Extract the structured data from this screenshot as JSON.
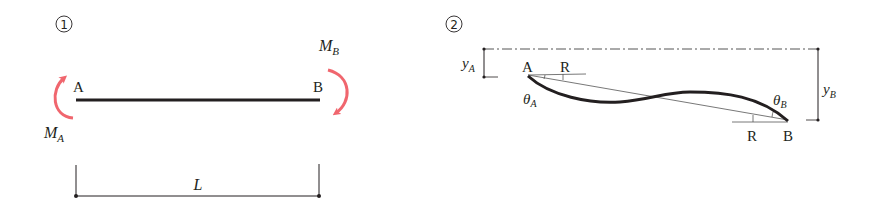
{
  "panels": [
    {
      "number": "1",
      "title": "Beam with end moments",
      "labels": {
        "left_end": "A",
        "right_end": "B",
        "moment_left_main": "M",
        "moment_left_sub": "A",
        "moment_right_main": "M",
        "moment_right_sub": "B",
        "length": "L"
      }
    },
    {
      "number": "2",
      "title": "Deflected beam",
      "labels": {
        "left_end": "A",
        "right_end": "B",
        "chord_ref_left": "R",
        "chord_ref_right": "R",
        "theta_left_main": "θ",
        "theta_left_sub": "A",
        "theta_right_main": "θ",
        "theta_right_sub": "B",
        "y_left_main": "y",
        "y_left_sub": "A",
        "y_right_main": "y",
        "y_right_sub": "B"
      }
    }
  ],
  "colors": {
    "line": "#231f20",
    "moment_arrow": "#f0666e",
    "thin_line": "#555555"
  }
}
